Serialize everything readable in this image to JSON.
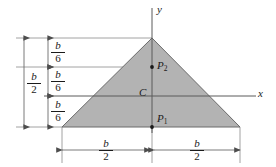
{
  "figure": {
    "background_color": "#ffffff",
    "fill_color": "#b3b3b3",
    "stroke_color": "#4d4d4d",
    "text_color": "#1a1a1a"
  },
  "axes": {
    "y_label": "y",
    "x_label": "x"
  },
  "points": {
    "p2_label": "P",
    "p2_sub": "2",
    "c_label": "C",
    "p1_label": "P",
    "p1_sub": "1"
  },
  "dimensions": {
    "total_left": {
      "numerator": "b",
      "denominator": "2"
    },
    "seg_top": {
      "numerator": "b",
      "denominator": "6"
    },
    "seg_mid": {
      "numerator": "b",
      "denominator": "6"
    },
    "seg_bottom": {
      "numerator": "b",
      "denominator": "6"
    },
    "base_left": {
      "numerator": "b",
      "denominator": "2"
    },
    "base_right": {
      "numerator": "b",
      "denominator": "2"
    }
  }
}
